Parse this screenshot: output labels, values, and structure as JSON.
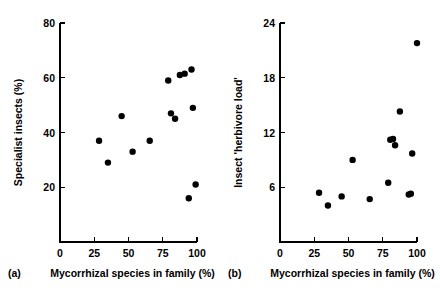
{
  "figure": {
    "background_color": "#ffffff",
    "marker_color": "#000000",
    "axis_color": "#000000"
  },
  "chart_data": [
    {
      "type": "scatter",
      "panel_label": "(a)",
      "title": "",
      "xlabel": "Mycorrhizal species in family (%)",
      "ylabel": "Specialist insects (%)",
      "xlim": [
        0,
        100
      ],
      "ylim": [
        0,
        80
      ],
      "xticks": [
        0,
        25,
        50,
        75,
        100
      ],
      "yticks": [
        20,
        40,
        60,
        80
      ],
      "xticklabels": [
        "0",
        "25",
        "50",
        "75",
        "100"
      ],
      "yticklabels": [
        "20",
        "40",
        "60",
        "80"
      ],
      "grid": false,
      "legend": false,
      "marker": "filled-circle",
      "points": [
        {
          "x": 28.5,
          "y": 37
        },
        {
          "x": 35,
          "y": 29
        },
        {
          "x": 45,
          "y": 46
        },
        {
          "x": 53,
          "y": 33
        },
        {
          "x": 65.5,
          "y": 37
        },
        {
          "x": 79,
          "y": 59
        },
        {
          "x": 81,
          "y": 47
        },
        {
          "x": 84,
          "y": 45
        },
        {
          "x": 87.5,
          "y": 61
        },
        {
          "x": 94,
          "y": 16
        },
        {
          "x": 96,
          "y": 63
        },
        {
          "x": 97,
          "y": 49
        },
        {
          "x": 99,
          "y": 21
        },
        {
          "x": 91,
          "y": 61.5
        }
      ]
    },
    {
      "type": "scatter",
      "panel_label": "(b)",
      "title": "",
      "xlabel": "Mycorrhizal species in family (%)",
      "ylabel": "Insect 'herbivore load'",
      "xlim": [
        0,
        100
      ],
      "ylim": [
        0,
        24
      ],
      "xticks": [
        0,
        25,
        50,
        75,
        100
      ],
      "yticks": [
        6,
        12,
        18,
        24
      ],
      "xticklabels": [
        "0",
        "25",
        "50",
        "75",
        "100"
      ],
      "yticklabels": [
        "6",
        "12",
        "18",
        "24"
      ],
      "grid": false,
      "legend": false,
      "marker": "filled-circle",
      "points": [
        {
          "x": 28.5,
          "y": 5.4
        },
        {
          "x": 35,
          "y": 4.0
        },
        {
          "x": 45,
          "y": 5.0
        },
        {
          "x": 53,
          "y": 9.0
        },
        {
          "x": 65.5,
          "y": 4.7
        },
        {
          "x": 79,
          "y": 6.5
        },
        {
          "x": 80.5,
          "y": 11.2
        },
        {
          "x": 84,
          "y": 10.6
        },
        {
          "x": 87.5,
          "y": 14.3
        },
        {
          "x": 94,
          "y": 5.2
        },
        {
          "x": 95.5,
          "y": 5.3
        },
        {
          "x": 96.5,
          "y": 9.7
        },
        {
          "x": 100,
          "y": 21.8
        },
        {
          "x": 82.5,
          "y": 11.3
        }
      ]
    }
  ]
}
